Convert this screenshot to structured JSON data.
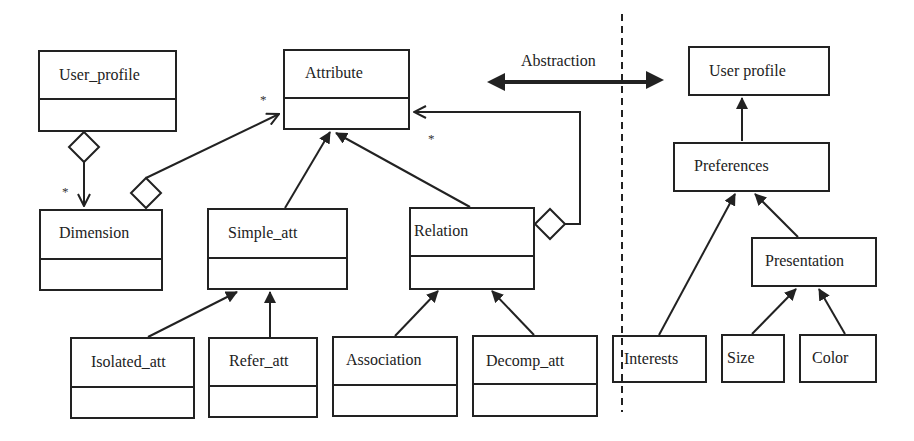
{
  "diagram": {
    "left_model": {
      "classes": [
        {
          "id": "user_profile",
          "name": "User_profile"
        },
        {
          "id": "attribute",
          "name": "Attribute"
        },
        {
          "id": "dimension",
          "name": "Dimension"
        },
        {
          "id": "simple_att",
          "name": "Simple_att"
        },
        {
          "id": "relation",
          "name": "Relation"
        },
        {
          "id": "isolated_att",
          "name": "Isolated_att"
        },
        {
          "id": "refer_att",
          "name": "Refer_att"
        },
        {
          "id": "association",
          "name": "Association"
        },
        {
          "id": "decomp_att",
          "name": "Decomp_att"
        }
      ],
      "relationships": [
        {
          "from": "User_profile",
          "to": "Dimension",
          "type": "aggregation",
          "multiplicity": "*"
        },
        {
          "from": "Dimension",
          "to": "Attribute",
          "type": "aggregation",
          "multiplicity": "*"
        },
        {
          "from": "Relation",
          "to": "Attribute",
          "type": "aggregation",
          "multiplicity": "*"
        },
        {
          "from": "Simple_att",
          "to": "Attribute",
          "type": "generalization"
        },
        {
          "from": "Relation",
          "to": "Attribute",
          "type": "generalization"
        },
        {
          "from": "Isolated_att",
          "to": "Simple_att",
          "type": "generalization"
        },
        {
          "from": "Refer_att",
          "to": "Simple_att",
          "type": "generalization"
        },
        {
          "from": "Association",
          "to": "Relation",
          "type": "generalization"
        },
        {
          "from": "Decomp_att",
          "to": "Relation",
          "type": "generalization"
        }
      ],
      "multiplicity_labels": [
        "*",
        "*",
        "*"
      ]
    },
    "abstraction": {
      "label": "Abstraction"
    },
    "right_model": {
      "classes": [
        {
          "id": "user_profile_r",
          "name": "User profile"
        },
        {
          "id": "preferences",
          "name": "Preferences"
        },
        {
          "id": "presentation",
          "name": "Presentation"
        },
        {
          "id": "interests",
          "name": "Interests"
        },
        {
          "id": "size",
          "name": "Size"
        },
        {
          "id": "color",
          "name": "Color"
        }
      ],
      "relationships": [
        {
          "from": "Preferences",
          "to": "User profile",
          "type": "generalization"
        },
        {
          "from": "Interests",
          "to": "Preferences",
          "type": "generalization"
        },
        {
          "from": "Presentation",
          "to": "Preferences",
          "type": "generalization"
        },
        {
          "from": "Size",
          "to": "Presentation",
          "type": "generalization"
        },
        {
          "from": "Color",
          "to": "Presentation",
          "type": "generalization"
        }
      ]
    },
    "colors": {
      "stroke": "#222222",
      "background": "#ffffff"
    }
  }
}
